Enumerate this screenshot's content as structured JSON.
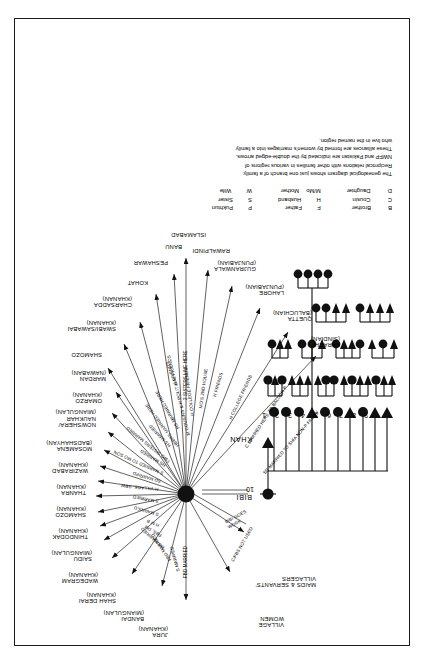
{
  "figure": {
    "type": "genealogical-kinship-diagram",
    "orientation": "rotated-90-ccw",
    "hub_label": "ego-household-hub"
  },
  "tree": {
    "father_label": "KHAN",
    "mother_label": "BIBI",
    "children_numbers": [
      "1",
      "2",
      "3",
      "4",
      "5",
      "6",
      "7",
      "8",
      "9",
      "10"
    ],
    "children_sex": [
      "F",
      "F",
      "F",
      "M",
      "F",
      "F",
      "M",
      "F",
      "M",
      "M"
    ]
  },
  "side_labels": [
    {
      "id": "village-women",
      "text": "VILLAGE\nWOMEN"
    },
    {
      "id": "maids-servants",
      "text": "MAIDS & SERVANTS'\nVILLAGERS"
    }
  ],
  "places": [
    {
      "id": "jura",
      "name": "JURA\n(KHANAN)"
    },
    {
      "id": "bandai",
      "name": "BANDAI\n(MIANGULAN)"
    },
    {
      "id": "shah-derai",
      "name": "SHAH DERAI\n(KHANAN)"
    },
    {
      "id": "wadegram",
      "name": "WADEGRAM\n(KHANAN)"
    },
    {
      "id": "saidu",
      "name": "SAIDU\n(MIANGULAN)"
    },
    {
      "id": "thindodak",
      "name": "THINDODAK\n(KHANAN)"
    },
    {
      "id": "shamozo",
      "name": "SHAMOZO\n(KHANAN)"
    },
    {
      "id": "thanra",
      "name": "THANRA\n(KHANAN)"
    },
    {
      "id": "wazirabad",
      "name": "WAZIRABAD\n(KHANAN)"
    },
    {
      "id": "mosamena",
      "name": "MOSAMENA\n(BADSHAHYAN)"
    },
    {
      "id": "nowshera",
      "name": "NOWSHERA/\nNAUKHAR\n(MIANGULAN)"
    },
    {
      "id": "omarzo",
      "name": "OMARZO\n(KHANAN)"
    },
    {
      "id": "mardan",
      "name": "MARDAN\n(NAWABAN)"
    },
    {
      "id": "shamozo-2",
      "name": "SHAMOZO"
    },
    {
      "id": "swabi",
      "name": "SWABI/SAWABAI\n(KHANAN)"
    },
    {
      "id": "charsadda",
      "name": "CHARSADDA\n(KHANAN)"
    },
    {
      "id": "kohat",
      "name": "KOHAT"
    },
    {
      "id": "peshawar",
      "name": "PESHAWAR"
    },
    {
      "id": "banu",
      "name": "BANU"
    },
    {
      "id": "islamabad",
      "name": "ISLAMABAD"
    },
    {
      "id": "rawalpindi",
      "name": "RAWALPINDI"
    },
    {
      "id": "gujranwala",
      "name": "GUJRANWALA\n(PUNJABIAN)"
    },
    {
      "id": "lahore",
      "name": "LAHORE\n(PUNJABIAN)"
    },
    {
      "id": "quetta",
      "name": "QUETTA\n(BALUCHIAN)"
    },
    {
      "id": "karachi",
      "name": "KARACHI\n(SINDIAN)"
    }
  ],
  "relations": [
    {
      "id": "r-jura",
      "text": "FBD MARRIED"
    },
    {
      "id": "r-bandai",
      "text": "S MARRIED"
    },
    {
      "id": "r-shahderai",
      "text": "FBD MARRIED"
    },
    {
      "id": "r-wadegram",
      "text": "MS MARRIED"
    },
    {
      "id": "r-saidu",
      "text": "FBS, DM"
    },
    {
      "id": "r-thindodak",
      "text": "H M B"
    },
    {
      "id": "r-shamozo",
      "text": "S MARRIED"
    },
    {
      "id": "r-thanra",
      "text": "S MARRIED"
    },
    {
      "id": "r-wazirabad",
      "text": "H VILLAGE, SBW"
    },
    {
      "id": "r-mosamena",
      "text": "SD MARRIED"
    },
    {
      "id": "r-nowshera",
      "text": "S MARRIED TO MO SON"
    },
    {
      "id": "r-omarzo",
      "text": "HS MARRIED"
    },
    {
      "id": "r-mardan",
      "text": "TWO SISTERS MARRIED"
    },
    {
      "id": "r-shamozo2",
      "text": "HS MARRIED"
    },
    {
      "id": "r-swabi",
      "text": "HBBRS MARRIED HERE"
    },
    {
      "id": "r-charsadda",
      "text": "HS MARRIED HERE"
    },
    {
      "id": "r-kohat",
      "text": "H FRIENDS"
    },
    {
      "id": "r-peshawar",
      "text": "M COUSINS & H POLITICAL FRIENDS"
    },
    {
      "id": "r-banu",
      "text": "H COLLEGE FRIENDS"
    },
    {
      "id": "r-islamabad",
      "text": "2 SISTERS LIVE HERE"
    },
    {
      "id": "r-rawalpindi",
      "text": "MO'S 2ND HOUSE"
    },
    {
      "id": "r-gujranwala",
      "text": "H FRIENDS"
    },
    {
      "id": "r-lahore",
      "text": "H COLLEGE FRIENDS"
    },
    {
      "id": "r-quetta",
      "text": "C MARRIED HERE TO BALUCH P"
    },
    {
      "id": "r-karachi",
      "text": "SD MARRIED TO SHIA NON-P FAMILY"
    },
    {
      "id": "r-villagewomen",
      "text": "C/FBS NOT USED"
    },
    {
      "id": "r-maids",
      "text": "BIBI GOES\nWORK"
    }
  ],
  "legend": {
    "column_1": [
      {
        "abbr": "B",
        "term": "Brother"
      },
      {
        "abbr": "C",
        "term": "Cousin"
      },
      {
        "abbr": "D",
        "term": "Daughter"
      }
    ],
    "column_2": [
      {
        "abbr": "F",
        "term": "Father"
      },
      {
        "abbr": "H",
        "term": "Husband"
      },
      {
        "abbr": "M/Mo",
        "term": "Mother"
      }
    ],
    "column_3": [
      {
        "abbr": "P",
        "term": "Pukhtun"
      },
      {
        "abbr": "S",
        "term": "Sister"
      },
      {
        "abbr": "W",
        "term": "Wife"
      }
    ]
  },
  "caption": {
    "line_1": "The genealogical diagram shows just one branch of a family.",
    "line_2": "Reciprocal relations with other families in various regions of",
    "line_3": "NWFP and Pakistan are indicated by the double-edged arrows.",
    "line_4": "These alliances are formed by women's marriages into a family",
    "line_5": "who live in the named region."
  },
  "colors": {
    "ink": "#111111",
    "paper": "#ffffff",
    "line": "#3a3a3a"
  }
}
